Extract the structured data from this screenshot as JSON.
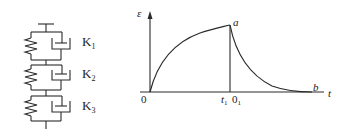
{
  "model": {
    "elements": [
      {
        "label": "K",
        "sub": "1"
      },
      {
        "label": "K",
        "sub": "2"
      },
      {
        "label": "K",
        "sub": "3"
      }
    ]
  },
  "graph": {
    "y_axis_label": "ε",
    "x_axis_label": "t",
    "origin_label": "0",
    "point_a_label": "a",
    "point_b_label": "b",
    "t1_label": "t",
    "t1_sub": "1",
    "o1_label": "0",
    "o1_sub": "1"
  },
  "colors": {
    "line": "#2a2a2a",
    "background": "#ffffff"
  }
}
